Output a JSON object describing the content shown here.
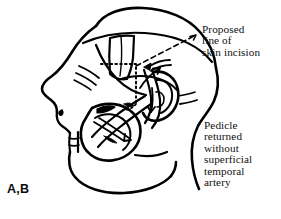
{
  "figure": {
    "label": "A,B",
    "type": "medical-line-illustration",
    "background_color": "#ffffff",
    "ink_color": "#000000"
  },
  "annotations": [
    {
      "id": "proposed-incision",
      "lines": [
        "Proposed",
        "line of",
        "skin incision"
      ],
      "leader": "dashed-line-with-arrowhead"
    },
    {
      "id": "pedicle-note",
      "lines": [
        "Pedicle",
        "returned",
        "without",
        "superficial",
        "temporal",
        "artery"
      ],
      "leader": "none"
    }
  ],
  "annotation_incision": {
    "line1": "Proposed",
    "line2": "line of",
    "line3": "skin incision"
  },
  "annotation_pedicle": {
    "line1": "Pedicle",
    "line2": "returned",
    "line3": "without",
    "line4": "superficial",
    "line5": "temporal",
    "line6": "artery"
  },
  "caption": {
    "remnant": ""
  }
}
